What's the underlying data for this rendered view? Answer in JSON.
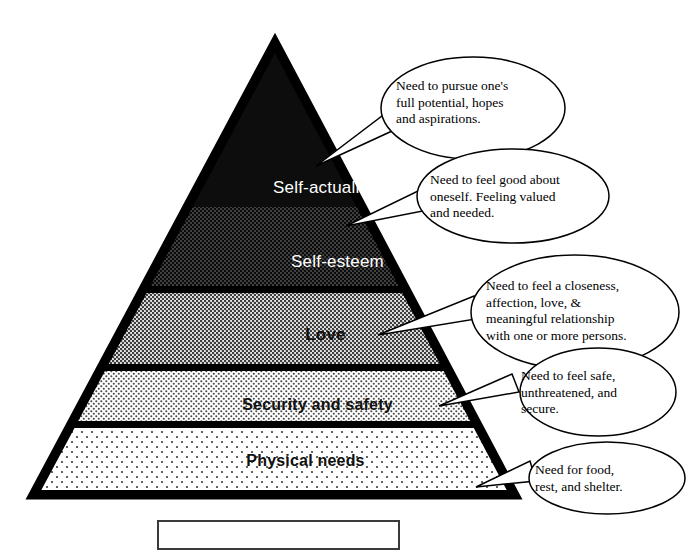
{
  "diagram": {
    "type": "pyramid-hierarchy",
    "levels": [
      {
        "id": "self-actualization",
        "rank": 5,
        "label": "Self-actualization",
        "fill": "solid-black",
        "fill_color": "#0d0d0d",
        "label_color": "#ffffff",
        "callout": "Need to pursue one's\nfull potential, hopes\nand aspirations."
      },
      {
        "id": "self-esteem",
        "rank": 4,
        "label": "Self-esteem",
        "fill": "dark-halftone",
        "fill_color": "#141414",
        "label_color": "#ffffff",
        "callout": "Need to feel good about\noneself. Feeling valued\nand needed."
      },
      {
        "id": "love",
        "rank": 3,
        "label": "Love",
        "fill": "medium-halftone",
        "fill_color": "#9a9a9a",
        "label_color": "#111111",
        "callout": "Need to feel a closeness,\naffection, love, &\nmeaningful relationship\nwith one or more persons."
      },
      {
        "id": "security-and-safety",
        "rank": 2,
        "label": "Security and safety",
        "fill": "light-halftone",
        "fill_color": "#d8d8d8",
        "label_color": "#111111",
        "callout": "Need to feel safe,\nunthreatened, and\nsecure."
      },
      {
        "id": "physical-needs",
        "rank": 1,
        "label": "Physical needs",
        "fill": "sparse-dots",
        "fill_color": "#f3f3f3",
        "label_color": "#111111",
        "callout": "Need for food,\nrest, and shelter."
      }
    ],
    "outline_color": "#000000",
    "background_color": "#ffffff",
    "caption_box": {
      "label": "",
      "border_color": "#3a3a3a"
    }
  }
}
